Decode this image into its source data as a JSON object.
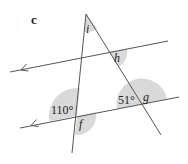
{
  "part_label": "c",
  "angles": {
    "i": "i",
    "h": "h",
    "known_left": "110°",
    "f": "f",
    "known_right": "51°",
    "g": "g"
  },
  "colors": {
    "line": "#555555",
    "arc_fill": "#d9d9d9",
    "text": "#222222"
  }
}
